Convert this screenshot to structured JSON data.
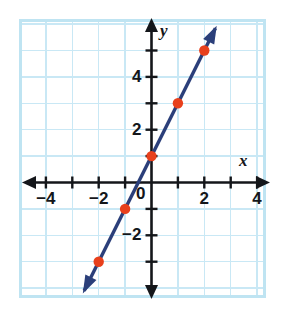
{
  "figure": {
    "name": "coordinate-plane-line-graph",
    "background_color": "#ffffff",
    "frame_color": "#BFE4F2"
  },
  "chart_data": {
    "type": "line",
    "title": "",
    "subtitle": "",
    "xlabel": "x",
    "ylabel": "y",
    "xlim": [
      -5,
      5
    ],
    "ylim": [
      -4,
      6
    ],
    "grid": true,
    "grid_spacing": 1,
    "legend": "none",
    "equation": "y = 2x + 1",
    "slope": 2,
    "y_intercept": 1,
    "x": [
      -2,
      -1,
      0,
      1,
      2
    ],
    "values": [
      -3,
      -1,
      1,
      3,
      5
    ],
    "points": [
      {
        "x": -2,
        "y": -3
      },
      {
        "x": -1,
        "y": -1
      },
      {
        "x": 0,
        "y": 1
      },
      {
        "x": 1,
        "y": 3
      },
      {
        "x": 2,
        "y": 5
      }
    ],
    "series": [
      {
        "name": "line",
        "color": "#2B3F7A",
        "marker_color": "#E8401C",
        "values": [
          -3,
          -1,
          1,
          3,
          5
        ],
        "arrows": [
          "start",
          "end"
        ]
      }
    ],
    "x_ticks": [
      -4,
      -3,
      -2,
      -1,
      0,
      1,
      2,
      3,
      4
    ],
    "y_ticks": [
      -3,
      -2,
      -1,
      0,
      1,
      2,
      3,
      4,
      5
    ],
    "x_tick_labels": [
      {
        "value": -4,
        "label": "−4"
      },
      {
        "value": -2,
        "label": "−2"
      },
      {
        "value": 2,
        "label": "2"
      },
      {
        "value": 4,
        "label": "4"
      }
    ],
    "y_tick_labels": [
      {
        "value": -2,
        "label": "−2"
      },
      {
        "value": 2,
        "label": "2"
      },
      {
        "value": 4,
        "label": "4"
      }
    ],
    "origin_label": "0",
    "axis_color": "#14161a",
    "grid_color": "#C9E8F5"
  },
  "labels": {
    "x_axis": "x",
    "y_axis": "y",
    "origin": "0"
  }
}
